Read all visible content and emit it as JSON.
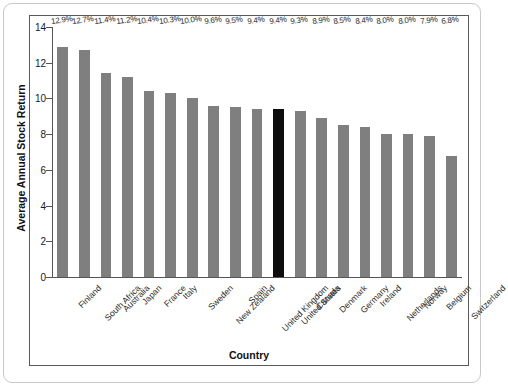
{
  "chart_data": {
    "type": "bar",
    "title": "",
    "xlabel": "Country",
    "ylabel": "Average Annual Stock Return",
    "ylim": [
      0,
      14
    ],
    "yticks": [
      0,
      2,
      4,
      6,
      8,
      10,
      12,
      14
    ],
    "ytick_labels": [
      "0",
      "2",
      "4",
      "6",
      "8",
      "10",
      "12",
      "14"
    ],
    "grid": false,
    "legend": null,
    "bar_color": "#7f7f7f",
    "highlight_color": "#0d0d0d",
    "highlight_category": "United States",
    "categories": [
      "Finland",
      "South Africa",
      "Australia",
      "Japan",
      "France",
      "Italy",
      "Sweden",
      "New Zealand",
      "Spain",
      "United Kingdom",
      "United States",
      "Canada",
      "Denmark",
      "Germany",
      "Ireland",
      "Netherlands",
      "Norway",
      "Belgium",
      "Switzerland"
    ],
    "values": [
      12.9,
      12.7,
      11.4,
      11.2,
      10.4,
      10.3,
      10.0,
      9.6,
      9.5,
      9.4,
      9.4,
      9.3,
      8.9,
      8.5,
      8.4,
      8.0,
      8.0,
      7.9,
      6.8
    ],
    "data_labels": [
      "12.9%",
      "12.7%",
      "11.4%",
      "11.2%",
      "10.4%",
      "10.3%",
      "10.0%",
      "9.6%",
      "9.5%",
      "9.4%",
      "9.4%",
      "9.3%",
      "8.9%",
      "8.5%",
      "8.4%",
      "8.0%",
      "8.0%",
      "7.9%",
      "6.8%"
    ]
  }
}
